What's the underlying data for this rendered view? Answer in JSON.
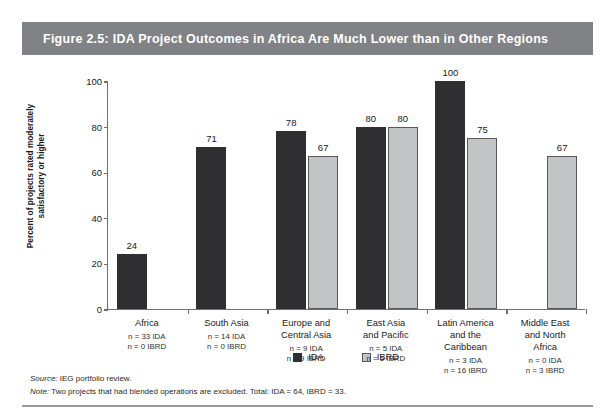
{
  "figure": {
    "title": "Figure 2.5:  IDA Project Outcomes in Africa Are Much Lower than in Other Regions",
    "title_band_color": "#818285",
    "source_label": "Source:",
    "source_text": " IEG portfolio review.",
    "note_label": "Note:",
    "note_text": " Two projects that had blended operations are excluded. Total: IDA = 64, IBRD = 33."
  },
  "legend": {
    "position": "bottom-center",
    "items": [
      {
        "label": "IDA",
        "color": "#2f2f31"
      },
      {
        "label": "IBRD",
        "color": "#c3c4c6"
      }
    ]
  },
  "axis": {
    "ylabel_line1": "Percent of projects rated moderately",
    "ylabel_line2": "satisfactory or higher",
    "yticks": [
      "0",
      "20",
      "40",
      "60",
      "80",
      "100"
    ]
  },
  "categories_detail": [
    {
      "name_line1": "Africa",
      "name_line2": "",
      "name_line3": "",
      "n_ida": "n = 33 IDA",
      "n_ibrd": "n = 0 IBRD"
    },
    {
      "name_line1": "South Asia",
      "name_line2": "",
      "name_line3": "",
      "n_ida": "n = 14 IDA",
      "n_ibrd": "n = 0 IBRD"
    },
    {
      "name_line1": "Europe and",
      "name_line2": "Central Asia",
      "name_line3": "",
      "n_ida": "n = 9 IDA",
      "n_ibrd": "n = 9 IBRD"
    },
    {
      "name_line1": "East Asia",
      "name_line2": "and Pacific",
      "name_line3": "",
      "n_ida": "n = 5 IDA",
      "n_ibrd": "n = 5 IBRD"
    },
    {
      "name_line1": "Latin America",
      "name_line2": "and the",
      "name_line3": "Caribbean",
      "n_ida": "n = 3 IDA",
      "n_ibrd": "n = 16 IBRD"
    },
    {
      "name_line1": "Middle East",
      "name_line2": "and North",
      "name_line3": "Africa",
      "n_ida": "n = 0 IDA",
      "n_ibrd": "n = 3 IBRD"
    }
  ],
  "chart_data": {
    "type": "bar",
    "title": "Figure 2.5:  IDA Project Outcomes in Africa Are Much Lower than in Other Regions",
    "xlabel": "",
    "ylabel": "Percent of projects rated moderately satisfactory or higher",
    "ylim": [
      0,
      100
    ],
    "ytick_values": [
      0,
      20,
      40,
      60,
      80,
      100
    ],
    "grid": false,
    "legend_position": "bottom-center",
    "categories": [
      "Africa",
      "South Asia",
      "Europe and Central Asia",
      "East Asia and Pacific",
      "Latin America and the Caribbean",
      "Middle East and North Africa"
    ],
    "series": [
      {
        "name": "IDA",
        "color": "#2f2f31",
        "values": [
          24,
          71,
          78,
          80,
          100,
          null
        ]
      },
      {
        "name": "IBRD",
        "color": "#c3c4c6",
        "values": [
          null,
          null,
          67,
          80,
          75,
          67
        ]
      }
    ],
    "sample_sizes": {
      "IDA": [
        33,
        14,
        9,
        5,
        3,
        0
      ],
      "IBRD": [
        0,
        0,
        9,
        5,
        16,
        3
      ]
    },
    "totals": {
      "IDA": 64,
      "IBRD": 33
    },
    "source": "IEG portfolio review.",
    "note": "Two projects that had blended operations are excluded. Total: IDA = 64, IBRD = 33."
  }
}
